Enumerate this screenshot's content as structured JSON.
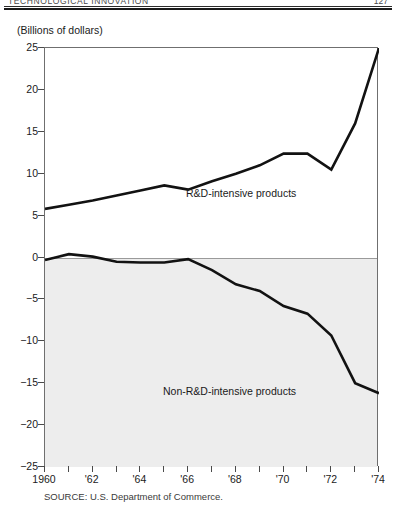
{
  "header": {
    "running_title": "TECHNOLOGICAL INNOVATION",
    "page_number": "127"
  },
  "axis_units_caption": "(Billions of dollars)",
  "source_note": "SOURCE: U.S. Department of Commerce.",
  "colors": {
    "line": "#121212",
    "negative_band": "#ededed",
    "frame": "#6f6f6f",
    "text": "#1a1a1a"
  },
  "chart_data": {
    "type": "line",
    "title": "",
    "subtitle": "",
    "xlabel": "",
    "ylabel": "(Billions of dollars)",
    "ylim": [
      -25,
      25
    ],
    "xlim": [
      1960,
      1974
    ],
    "grid": false,
    "legend": "inline-annotations",
    "y_ticks": [
      25,
      20,
      15,
      10,
      5,
      0,
      -5,
      -10,
      -15,
      -20,
      -25
    ],
    "y_tick_labels": [
      "25",
      "20",
      "15",
      "10",
      "5",
      "0",
      "−5",
      "−10",
      "−15",
      "−20",
      "−25"
    ],
    "x_ticks": [
      1960,
      1961,
      1962,
      1963,
      1964,
      1965,
      1966,
      1967,
      1968,
      1969,
      1970,
      1971,
      1972,
      1973,
      1974
    ],
    "x_tick_labels": [
      "1960",
      "",
      "'62",
      "",
      "'64",
      "",
      "'66",
      "",
      "'68",
      "",
      "'70",
      "",
      "'72",
      "",
      "'74"
    ],
    "x_labeled_ticks": [
      {
        "x": 1960,
        "label": "1960"
      },
      {
        "x": 1962,
        "label": "'62"
      },
      {
        "x": 1964,
        "label": "'64"
      },
      {
        "x": 1966,
        "label": "'66"
      },
      {
        "x": 1968,
        "label": "'68"
      },
      {
        "x": 1970,
        "label": "'70"
      },
      {
        "x": 1972,
        "label": "'72"
      },
      {
        "x": 1974,
        "label": "'74"
      }
    ],
    "x": [
      1960,
      1961,
      1962,
      1963,
      1964,
      1965,
      1966,
      1967,
      1968,
      1969,
      1970,
      1971,
      1972,
      1973,
      1974
    ],
    "series": [
      {
        "name": "R&D-intensive products",
        "values": [
          5.8,
          6.3,
          6.8,
          7.4,
          8.0,
          8.6,
          8.1,
          9.1,
          10.0,
          11.0,
          12.4,
          12.4,
          10.5,
          16.0,
          25.0
        ]
      },
      {
        "name": "Non-R&D-intensive products",
        "values": [
          -0.3,
          0.4,
          0.1,
          -0.5,
          -0.6,
          -0.6,
          -0.2,
          -1.5,
          -3.2,
          -4.0,
          -5.8,
          -6.7,
          -9.3,
          -15.0,
          -16.2
        ]
      }
    ],
    "annotations": [
      {
        "text": "R&D-intensive products",
        "x": 1964.5,
        "y": 11.0
      },
      {
        "text": "Non-R&D-intensive products",
        "x": 1963.6,
        "y": -11.5
      }
    ]
  }
}
